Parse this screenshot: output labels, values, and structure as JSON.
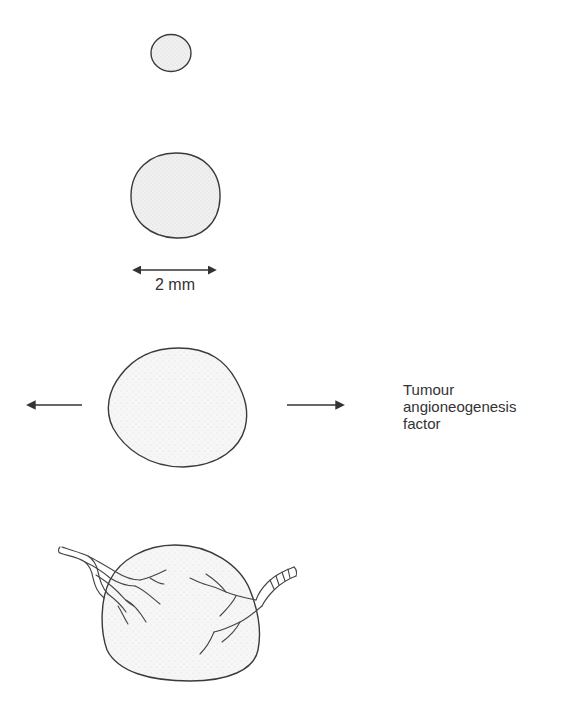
{
  "diagram": {
    "stages": [
      {
        "name": "small-avascular-tumour",
        "description": "small tumour nodule"
      },
      {
        "name": "medium-avascular-tumour",
        "description": "tumour limited to ~2 mm"
      },
      {
        "name": "tumour-secreting-factor",
        "description": "tumour releasing factor"
      },
      {
        "name": "vascularised-tumour",
        "description": "tumour with new blood vessels"
      }
    ],
    "scale_label": "2 mm",
    "factor_label": {
      "line1": "Tumour",
      "line2": "angioneogenesis",
      "line3": "factor"
    }
  },
  "colors": {
    "outline": "#3a3a3a",
    "fill": "#f2f2f2",
    "text": "#333333",
    "background": "#ffffff"
  }
}
